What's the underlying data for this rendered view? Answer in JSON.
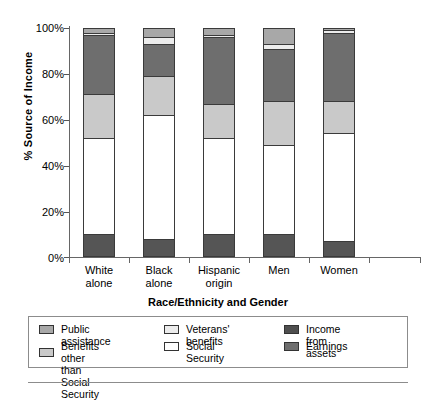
{
  "chart_data": {
    "type": "bar",
    "stacked": true,
    "title": "",
    "xlabel": "Race/Ethnicity and Gender",
    "ylabel": "% Source of Income",
    "categories": [
      "White\nalone",
      "Black\nalone",
      "Hispanic\norigin",
      "Men",
      "Women"
    ],
    "ylim": [
      0,
      100
    ],
    "ytick_labels": [
      "0%",
      "20%",
      "40%",
      "60%",
      "80%",
      "100%"
    ],
    "ytick_values": [
      0,
      20,
      40,
      60,
      80,
      100
    ],
    "grid": false,
    "legend_position": "bottom",
    "series": [
      {
        "name": "Earnings",
        "color": "#555555",
        "values": [
          10,
          8,
          10,
          10,
          7
        ]
      },
      {
        "name": "Social Security",
        "color": "#ffffff",
        "values": [
          42,
          54,
          42,
          39,
          47
        ]
      },
      {
        "name": "Income from assets",
        "color": "#c9c9c9",
        "values": [
          19,
          17,
          15,
          19,
          14
        ]
      },
      {
        "name": "Benefits other than Social Security",
        "color": "#6e6e6e",
        "values": [
          26,
          14,
          29,
          23,
          30
        ]
      },
      {
        "name": "Veterans' benefits",
        "color": "#ececec",
        "values": [
          1,
          3,
          1,
          2,
          1
        ]
      },
      {
        "name": "Public assistance",
        "color": "#a8a8a8",
        "values": [
          2,
          4,
          3,
          7,
          1
        ]
      }
    ]
  },
  "legend": {
    "entries": [
      {
        "label": "Public assistance",
        "color": "#a8a8a8"
      },
      {
        "label": "Benefits other than\nSocial Security",
        "color": "#c9c9c9"
      },
      {
        "label": "Veterans' benefits",
        "color": "#ececec"
      },
      {
        "label": "Social Security",
        "color": "#ffffff"
      },
      {
        "label": "Income from assets",
        "color": "#4f4f4f"
      },
      {
        "label": "Earnings",
        "color": "#6e6e6e"
      }
    ]
  }
}
